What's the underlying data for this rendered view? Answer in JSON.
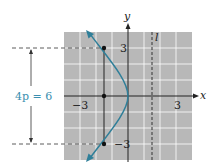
{
  "figure": {
    "axis_x_label": "x",
    "axis_y_label": "y",
    "directrix_label": "l",
    "tick_x_neg": "−3",
    "tick_x_pos": "3",
    "tick_y_pos": "3",
    "tick_y_neg": "−3",
    "focal_width_label": "4p = 6",
    "colors": {
      "grid_background": "#b8b8b8",
      "grid_lines": "#ffffff",
      "curve": "#2f7f99",
      "annotation": "#3a8fb0",
      "axes": "#222222"
    },
    "parabola": {
      "equation_form": "y^2 = -6x",
      "vertex": [
        0,
        0
      ],
      "focus": [
        -1.5,
        0
      ],
      "directrix_x": 1.5,
      "latus_rectum_endpoints": [
        [
          -1.5,
          3
        ],
        [
          -1.5,
          -3
        ]
      ]
    },
    "grid_range": {
      "x": [
        -4,
        4
      ],
      "y": [
        -4,
        4
      ]
    }
  }
}
